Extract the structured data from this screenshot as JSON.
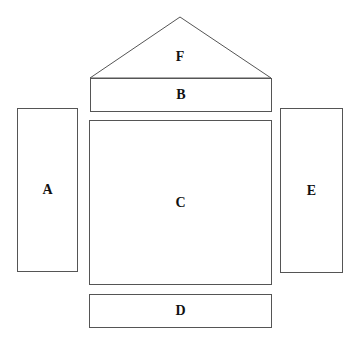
{
  "diagram": {
    "type": "block-layout",
    "regions": [
      {
        "id": "F",
        "label": "F",
        "shape": "triangle"
      },
      {
        "id": "B",
        "label": "B",
        "shape": "rectangle"
      },
      {
        "id": "A",
        "label": "A",
        "shape": "rectangle"
      },
      {
        "id": "C",
        "label": "C",
        "shape": "rectangle"
      },
      {
        "id": "E",
        "label": "E",
        "shape": "rectangle"
      },
      {
        "id": "D",
        "label": "D",
        "shape": "rectangle"
      }
    ]
  }
}
